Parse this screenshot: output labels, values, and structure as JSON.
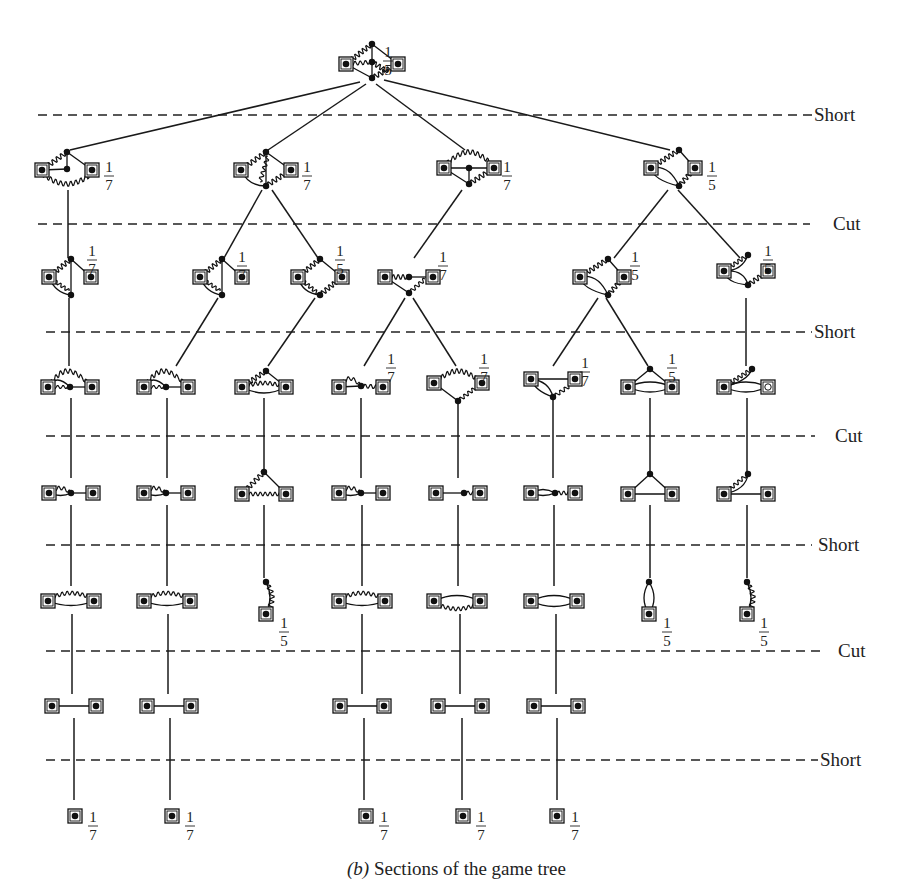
{
  "caption": {
    "prefix": "(b)",
    "text": " Sections of the game tree"
  },
  "levels": [
    {
      "label": "Short",
      "y": 115,
      "x1": 38,
      "x2": 812,
      "label_x": 814
    },
    {
      "label": "Cut",
      "y": 224,
      "x1": 38,
      "x2": 810,
      "label_x": 833
    },
    {
      "label": "Short",
      "y": 332,
      "x1": 46,
      "x2": 812,
      "label_x": 814
    },
    {
      "label": "Cut",
      "y": 436,
      "x1": 46,
      "x2": 815,
      "label_x": 835
    },
    {
      "label": "Short",
      "y": 545,
      "x1": 46,
      "x2": 812,
      "label_x": 818
    },
    {
      "label": "Cut",
      "y": 651,
      "x1": 46,
      "x2": 820,
      "label_x": 838
    },
    {
      "label": "Short",
      "y": 760,
      "x1": 46,
      "x2": 818,
      "label_x": 820
    }
  ],
  "nodes": [
    {
      "id": "root",
      "x": 372,
      "y": 62,
      "kind": "k4w",
      "frac": "1/5",
      "fx": 388,
      "fy": 45
    },
    {
      "id": "a",
      "x": 67,
      "y": 170,
      "kind": "tri_w",
      "frac": "1/7",
      "fx": 109,
      "fy": 160
    },
    {
      "id": "b",
      "x": 266,
      "y": 170,
      "kind": "k4a",
      "frac": "1/7",
      "fx": 307,
      "fy": 160
    },
    {
      "id": "c",
      "x": 469,
      "y": 168,
      "kind": "k4b",
      "frac": "1/7",
      "fx": 507,
      "fy": 160
    },
    {
      "id": "d",
      "x": 673,
      "y": 168,
      "kind": "dia_loop",
      "frac": "1/5",
      "fx": 712,
      "fy": 160
    },
    {
      "id": "a1",
      "x": 69,
      "y": 277,
      "kind": "tri_w2",
      "frac": "1/7",
      "fx": 92,
      "fy": 244
    },
    {
      "id": "b1",
      "x": 220,
      "y": 277,
      "kind": "tri_w2",
      "frac": "1/7",
      "fx": 242,
      "fy": 250
    },
    {
      "id": "b2",
      "x": 320,
      "y": 277,
      "kind": "dia_w",
      "frac": "1/5",
      "fx": 340,
      "fy": 244
    },
    {
      "id": "c1",
      "x": 409,
      "y": 277,
      "kind": "v_w",
      "frac": "1/7",
      "fx": 443,
      "fy": 250
    },
    {
      "id": "d1",
      "x": 602,
      "y": 277,
      "kind": "dia_loop",
      "frac": "1/5",
      "fx": 635,
      "fy": 250
    },
    {
      "id": "d2",
      "x": 746,
      "y": 277,
      "kind": "fan_w",
      "frac": "1/5",
      "fx": 768,
      "fy": 244
    },
    {
      "id": "a2",
      "x": 70,
      "y": 385,
      "kind": "arch_w",
      "frac": "",
      "fx": 0,
      "fy": 0
    },
    {
      "id": "b1a",
      "x": 166,
      "y": 385,
      "kind": "arch_w",
      "frac": "",
      "fx": 0,
      "fy": 0
    },
    {
      "id": "b2a",
      "x": 264,
      "y": 385,
      "kind": "tri_top",
      "frac": "",
      "fx": 0,
      "fy": 0
    },
    {
      "id": "c1a",
      "x": 361,
      "y": 385,
      "kind": "line_w",
      "frac": "1/7",
      "fx": 391,
      "fy": 352
    },
    {
      "id": "c1b",
      "x": 458,
      "y": 385,
      "kind": "arch_down",
      "frac": "1/7",
      "fx": 484,
      "fy": 352
    },
    {
      "id": "d1a",
      "x": 553,
      "y": 385,
      "kind": "v_loop",
      "frac": "1/7",
      "fx": 585,
      "fy": 356
    },
    {
      "id": "d1b",
      "x": 650,
      "y": 385,
      "kind": "tri_lens",
      "frac": "1/5",
      "fx": 672,
      "fy": 352
    },
    {
      "id": "d2a",
      "x": 746,
      "y": 385,
      "kind": "lens_w",
      "frac": "",
      "fx": 0,
      "fy": 0
    },
    {
      "id": "a3",
      "x": 71,
      "y": 492,
      "kind": "path_w",
      "frac": "",
      "fx": 0,
      "fy": 0
    },
    {
      "id": "b1b",
      "x": 166,
      "y": 492,
      "kind": "path_w",
      "frac": "",
      "fx": 0,
      "fy": 0
    },
    {
      "id": "b2b",
      "x": 264,
      "y": 492,
      "kind": "tri_top_w",
      "frac": "",
      "fx": 0,
      "fy": 0
    },
    {
      "id": "c1c",
      "x": 361,
      "y": 492,
      "kind": "path_w",
      "frac": "",
      "fx": 0,
      "fy": 0
    },
    {
      "id": "c1d",
      "x": 458,
      "y": 492,
      "kind": "path_w2",
      "frac": "",
      "fx": 0,
      "fy": 0
    },
    {
      "id": "d1c",
      "x": 553,
      "y": 492,
      "kind": "path_lens",
      "frac": "",
      "fx": 0,
      "fy": 0
    },
    {
      "id": "d1d",
      "x": 650,
      "y": 492,
      "kind": "triangle",
      "frac": "",
      "fx": 0,
      "fy": 0
    },
    {
      "id": "d2b",
      "x": 746,
      "y": 492,
      "kind": "hook_w",
      "frac": "",
      "fx": 0,
      "fy": 0
    },
    {
      "id": "a4",
      "x": 71,
      "y": 600,
      "kind": "arch_w2",
      "frac": "",
      "fx": 0,
      "fy": 0
    },
    {
      "id": "b1c",
      "x": 167,
      "y": 600,
      "kind": "arch_w2",
      "frac": "",
      "fx": 0,
      "fy": 0
    },
    {
      "id": "b2c",
      "x": 266,
      "y": 600,
      "kind": "vert_w",
      "frac": "1/5",
      "fx": 284,
      "fy": 616
    },
    {
      "id": "c1e",
      "x": 362,
      "y": 600,
      "kind": "arch_w2",
      "frac": "",
      "fx": 0,
      "fy": 0
    },
    {
      "id": "c1f",
      "x": 457,
      "y": 600,
      "kind": "arch_w3",
      "frac": "",
      "fx": 0,
      "fy": 0
    },
    {
      "id": "d1e",
      "x": 554,
      "y": 600,
      "kind": "lens",
      "frac": "",
      "fx": 0,
      "fy": 0
    },
    {
      "id": "d1f",
      "x": 649,
      "y": 600,
      "kind": "vert_lens",
      "frac": "1/5",
      "fx": 667,
      "fy": 616
    },
    {
      "id": "d2c",
      "x": 747,
      "y": 600,
      "kind": "vert_w",
      "frac": "1/5",
      "fx": 764,
      "fy": 616
    },
    {
      "id": "a5",
      "x": 74,
      "y": 706,
      "kind": "edge2",
      "frac": "",
      "fx": 0,
      "fy": 0
    },
    {
      "id": "b1d",
      "x": 169,
      "y": 706,
      "kind": "edge2",
      "frac": "",
      "fx": 0,
      "fy": 0
    },
    {
      "id": "c1g",
      "x": 362,
      "y": 706,
      "kind": "edge2",
      "frac": "",
      "fx": 0,
      "fy": 0
    },
    {
      "id": "c1h",
      "x": 460,
      "y": 706,
      "kind": "edge2",
      "frac": "",
      "fx": 0,
      "fy": 0
    },
    {
      "id": "d1g",
      "x": 556,
      "y": 706,
      "kind": "edge2",
      "frac": "",
      "fx": 0,
      "fy": 0
    },
    {
      "id": "a6",
      "x": 75,
      "y": 816,
      "kind": "single",
      "frac": "1/7",
      "fx": 93,
      "fy": 810
    },
    {
      "id": "b1e",
      "x": 172,
      "y": 816,
      "kind": "single",
      "frac": "1/7",
      "fx": 190,
      "fy": 810
    },
    {
      "id": "c1i",
      "x": 366,
      "y": 816,
      "kind": "single",
      "frac": "1/7",
      "fx": 384,
      "fy": 810
    },
    {
      "id": "c1j",
      "x": 463,
      "y": 816,
      "kind": "single",
      "frac": "1/7",
      "fx": 481,
      "fy": 810
    },
    {
      "id": "d1h",
      "x": 557,
      "y": 816,
      "kind": "single",
      "frac": "1/7",
      "fx": 575,
      "fy": 810
    }
  ],
  "edges": [
    [
      "root",
      "a",
      360,
      82,
      70,
      150
    ],
    [
      "root",
      "b",
      366,
      84,
      268,
      150
    ],
    [
      "root",
      "c",
      376,
      84,
      465,
      150
    ],
    [
      "root",
      "d",
      384,
      80,
      670,
      150
    ],
    [
      "a",
      "a1",
      68,
      190,
      68,
      258
    ],
    [
      "b",
      "b1",
      262,
      190,
      224,
      258
    ],
    [
      "b",
      "b2",
      272,
      190,
      318,
      258
    ],
    [
      "c",
      "c1",
      462,
      190,
      414,
      258
    ],
    [
      "d",
      "d1",
      668,
      190,
      614,
      258
    ],
    [
      "d",
      "d2",
      678,
      190,
      740,
      258
    ],
    [
      "a1",
      "a2",
      69,
      298,
      69,
      366
    ],
    [
      "b1",
      "b1a",
      218,
      298,
      176,
      366
    ],
    [
      "b2",
      "b2a",
      315,
      298,
      268,
      366
    ],
    [
      "c1",
      "c1a",
      405,
      298,
      364,
      366
    ],
    [
      "c1",
      "c1b",
      413,
      298,
      456,
      366
    ],
    [
      "d1",
      "d1a",
      598,
      298,
      553,
      366
    ],
    [
      "d1",
      "d1b",
      606,
      298,
      648,
      366
    ],
    [
      "d2",
      "d2a",
      746,
      298,
      746,
      366
    ],
    [
      "a2",
      "a3",
      71,
      398,
      71,
      478
    ],
    [
      "b1a",
      "b1b",
      167,
      398,
      167,
      478
    ],
    [
      "b2a",
      "b2b",
      264,
      398,
      264,
      472
    ],
    [
      "c1a",
      "c1c",
      361,
      398,
      361,
      478
    ],
    [
      "c1b",
      "c1d",
      458,
      400,
      458,
      478
    ],
    [
      "d1a",
      "d1c",
      553,
      400,
      553,
      478
    ],
    [
      "d1b",
      "d1d",
      650,
      398,
      650,
      472
    ],
    [
      "d2a",
      "d2b",
      747,
      398,
      747,
      472
    ],
    [
      "a3",
      "a4",
      71,
      505,
      71,
      586
    ],
    [
      "b1b",
      "b1c",
      167,
      505,
      167,
      586
    ],
    [
      "b2b",
      "b2c",
      264,
      505,
      264,
      578
    ],
    [
      "c1c",
      "c1e",
      362,
      505,
      362,
      586
    ],
    [
      "c1d",
      "c1f",
      458,
      505,
      458,
      586
    ],
    [
      "d1c",
      "d1e",
      554,
      505,
      554,
      586
    ],
    [
      "d1d",
      "d1f",
      650,
      505,
      650,
      578
    ],
    [
      "d2b",
      "d2c",
      747,
      505,
      747,
      578
    ],
    [
      "a4",
      "a5",
      72,
      614,
      72,
      694
    ],
    [
      "b1c",
      "b1d",
      168,
      614,
      168,
      694
    ],
    [
      "c1e",
      "c1g",
      362,
      614,
      362,
      694
    ],
    [
      "c1f",
      "c1h",
      460,
      614,
      460,
      694
    ],
    [
      "d1e",
      "d1g",
      556,
      614,
      556,
      694
    ],
    [
      "a5",
      "a6",
      74,
      718,
      74,
      800
    ],
    [
      "b1d",
      "b1e",
      170,
      718,
      170,
      800
    ],
    [
      "c1g",
      "c1i",
      364,
      718,
      364,
      800
    ],
    [
      "c1h",
      "c1j",
      462,
      718,
      462,
      800
    ],
    [
      "d1g",
      "d1h",
      557,
      718,
      557,
      800
    ]
  ]
}
